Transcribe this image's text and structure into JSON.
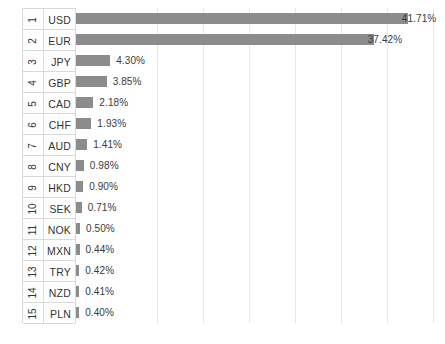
{
  "chart_data": {
    "type": "bar",
    "orientation": "horizontal",
    "title": "",
    "subtitle": "",
    "xlabel": "",
    "ylabel": "",
    "grid": true,
    "legend": null,
    "legend_position": "none",
    "xlim": [
      0,
      45.5
    ],
    "gridline_values": [
      10.18,
      15.96,
      21.74,
      27.52,
      33.3,
      39.08,
      44.86
    ],
    "categories": [
      "USD",
      "EUR",
      "JPY",
      "GBP",
      "CAD",
      "CHF",
      "AUD",
      "CNY",
      "HKD",
      "SEK",
      "NOK",
      "MXN",
      "TRY",
      "NZD",
      "PLN"
    ],
    "values": [
      41.71,
      37.42,
      4.3,
      3.85,
      2.18,
      1.93,
      1.41,
      0.98,
      0.9,
      0.71,
      0.5,
      0.44,
      0.42,
      0.41,
      0.4
    ],
    "data_labels": [
      "41.71%",
      "37.42%",
      "4.30%",
      "3.85%",
      "2.18%",
      "1.93%",
      "1.41%",
      "0.98%",
      "0.90%",
      "0.71%",
      "0.50%",
      "0.44%",
      "0.42%",
      "0.41%",
      "0.40%"
    ],
    "ranks": [
      "1",
      "2",
      "3",
      "4",
      "5",
      "6",
      "7",
      "8",
      "9",
      "10",
      "11",
      "12",
      "13",
      "14",
      "15"
    ],
    "bar_color": "#8c8c8c",
    "background_color": "#ffffff",
    "gridline_color": "#e4e6e9",
    "border_color": "#d9d9d9",
    "label_color": "#3a3a3a"
  },
  "table": {
    "rows": [
      {
        "rank": "1",
        "code": "USD",
        "value": 41.71,
        "label": "41.71%"
      },
      {
        "rank": "2",
        "code": "EUR",
        "value": 37.42,
        "label": "37.42%"
      },
      {
        "rank": "3",
        "code": "JPY",
        "value": 4.3,
        "label": "4.30%"
      },
      {
        "rank": "4",
        "code": "GBP",
        "value": 3.85,
        "label": "3.85%"
      },
      {
        "rank": "5",
        "code": "CAD",
        "value": 2.18,
        "label": "2.18%"
      },
      {
        "rank": "6",
        "code": "CHF",
        "value": 1.93,
        "label": "1.93%"
      },
      {
        "rank": "7",
        "code": "AUD",
        "value": 1.41,
        "label": "1.41%"
      },
      {
        "rank": "8",
        "code": "CNY",
        "value": 0.98,
        "label": "0.98%"
      },
      {
        "rank": "9",
        "code": "HKD",
        "value": 0.9,
        "label": "0.90%"
      },
      {
        "rank": "10",
        "code": "SEK",
        "value": 0.71,
        "label": "0.71%"
      },
      {
        "rank": "11",
        "code": "NOK",
        "value": 0.5,
        "label": "0.50%"
      },
      {
        "rank": "12",
        "code": "MXN",
        "value": 0.44,
        "label": "0.44%"
      },
      {
        "rank": "13",
        "code": "TRY",
        "value": 0.42,
        "label": "0.42%"
      },
      {
        "rank": "14",
        "code": "NZD",
        "value": 0.41,
        "label": "0.41%"
      },
      {
        "rank": "15",
        "code": "PLN",
        "value": 0.4,
        "label": "0.40%"
      }
    ]
  }
}
